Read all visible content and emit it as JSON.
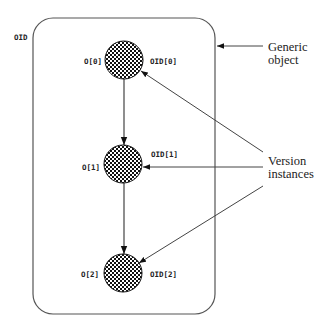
{
  "diagram": {
    "colors": {
      "stroke": "#555555",
      "text": "#222222",
      "dark": "#111111",
      "light": "#ffffff"
    },
    "outer_label": "OID",
    "container": {
      "label_line1": "Generic",
      "label_line2": "object"
    },
    "versions_label": {
      "line1": "Version",
      "line2": "instances"
    },
    "nodes": [
      {
        "left_label": "O[0]",
        "right_label": "OID[0]"
      },
      {
        "left_label": "O[1]",
        "right_label": "OID[1]"
      },
      {
        "left_label": "O[2]",
        "right_label": "OID[2]"
      }
    ]
  }
}
